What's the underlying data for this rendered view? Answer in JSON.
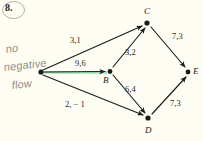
{
  "page": {
    "problem_number": "8.",
    "background_color": "#fdfdf3",
    "ink_color": "#1b1b1b",
    "highlight_color": "#9fe3b4",
    "annotation_color": "#8f8f86"
  },
  "annotation": {
    "line1": "no",
    "line2": "negative",
    "line3": "flow",
    "full_text": "no negative flow"
  },
  "graph": {
    "type": "directed-network-flow-diagram",
    "nodes": [
      {
        "id": "A",
        "label": "",
        "x": 41,
        "y": 72
      },
      {
        "id": "B",
        "label": "B",
        "x": 110,
        "y": 71
      },
      {
        "id": "C",
        "label": "C",
        "x": 147,
        "y": 23
      },
      {
        "id": "D",
        "label": "D",
        "x": 148,
        "y": 118
      },
      {
        "id": "E",
        "label": "E",
        "x": 188,
        "y": 72
      }
    ],
    "edges": [
      {
        "from": "A",
        "to": "C",
        "label": "3,1",
        "capacity": 3,
        "flow": 1,
        "highlighted": false
      },
      {
        "from": "A",
        "to": "B",
        "label": "9,6",
        "capacity": 9,
        "flow": 6,
        "highlighted": true
      },
      {
        "from": "A",
        "to": "D",
        "label": "2, − 1",
        "capacity": 2,
        "flow": -1,
        "highlighted": false
      },
      {
        "from": "B",
        "to": "C",
        "label": "3,2",
        "capacity": 3,
        "flow": 2,
        "highlighted": false
      },
      {
        "from": "B",
        "to": "D",
        "label": "6,4",
        "capacity": 6,
        "flow": 4,
        "highlighted": false
      },
      {
        "from": "C",
        "to": "E",
        "label": "7,3",
        "capacity": 7,
        "flow": 3,
        "highlighted": false
      },
      {
        "from": "D",
        "to": "E",
        "label": "7,3",
        "capacity": 7,
        "flow": 3,
        "highlighted": false
      }
    ]
  },
  "labels": {
    "node_c": "C",
    "node_b": "B",
    "node_d": "D",
    "node_e": "E",
    "edge_ac": "3,1",
    "edge_ab": "9,6",
    "edge_ad": "2, − 1",
    "edge_bc": "3,2",
    "edge_bd": "6,4",
    "edge_ce": "7,3",
    "edge_de": "7,3"
  }
}
